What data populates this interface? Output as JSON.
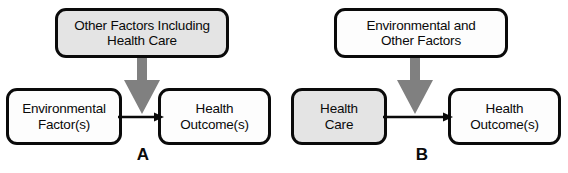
{
  "figure": {
    "background_color": "#ffffff",
    "box_border_color": "#0a0a0a",
    "block_arrow_color": "#808080",
    "line_arrow_color": "#0a0a0a",
    "gray_fill": "#e4e4e4",
    "white_fill": "#fdfdfd"
  },
  "panels": [
    {
      "letter": "A",
      "top_box": {
        "label": "Other Factors Including Health Care",
        "line1": "Other Factors Including",
        "line2": "Health Care",
        "fill": "gray"
      },
      "left_box": {
        "label": "Environmental Factor(s)",
        "line1": "Environmental",
        "line2": "Factor(s)",
        "fill": "white"
      },
      "right_box": {
        "label": "Health Outcome(s)",
        "line1": "Health",
        "line2": "Outcome(s)",
        "fill": "white"
      }
    },
    {
      "letter": "B",
      "top_box": {
        "label": "Environmental and Other Factors",
        "line1": "Environmental and",
        "line2": "Other Factors",
        "fill": "white"
      },
      "left_box": {
        "label": "Health Care",
        "line1": "Health",
        "line2": "Care",
        "fill": "gray"
      },
      "right_box": {
        "label": "Health Outcome(s)",
        "line1": "Health",
        "line2": "Outcome(s)",
        "fill": "white"
      }
    }
  ]
}
